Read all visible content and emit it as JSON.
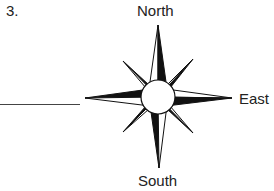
{
  "question": {
    "number": "3."
  },
  "compass": {
    "labels": {
      "north": "North",
      "east": "East",
      "south": "South",
      "west": ""
    },
    "blank_for": "west",
    "colors": {
      "ink": "#111111",
      "fill_light": "#ffffff"
    }
  }
}
